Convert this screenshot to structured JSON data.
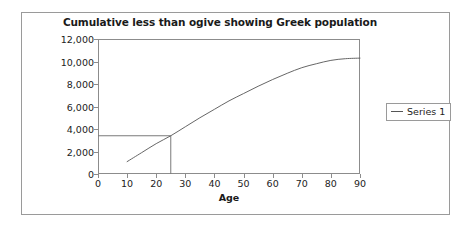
{
  "chart_data": {
    "type": "line",
    "title": "Cumulative less than ogive showing Greek population",
    "xlabel": "Age",
    "ylabel": "Population",
    "xlim": [
      0,
      90
    ],
    "ylim": [
      0,
      12000
    ],
    "grid": false,
    "legend_position": "right",
    "x_ticks": [
      0,
      10,
      20,
      30,
      40,
      50,
      60,
      70,
      80,
      90
    ],
    "x_tick_labels": [
      "0",
      "10",
      "20",
      "30",
      "40",
      "50",
      "60",
      "70",
      "80",
      "90"
    ],
    "y_ticks": [
      0,
      2000,
      4000,
      6000,
      8000,
      10000,
      12000
    ],
    "y_tick_labels": [
      "0",
      "2,000",
      "4,000",
      "6,000",
      "8,000",
      "10,000",
      "12,000"
    ],
    "series": [
      {
        "name": "Series 1",
        "color": "#555555",
        "x": [
          10,
          15,
          20,
          25,
          30,
          35,
          40,
          45,
          50,
          55,
          60,
          65,
          70,
          75,
          80,
          85,
          90
        ],
        "values": [
          1100,
          1900,
          2700,
          3400,
          4200,
          5000,
          5750,
          6500,
          7150,
          7800,
          8400,
          8950,
          9450,
          9800,
          10100,
          10250,
          10300
        ]
      }
    ],
    "annotations": [
      {
        "name": "median-construction-lines",
        "x": 25,
        "y": 3400,
        "description": "horizontal line from y-axis to curve at 3,400 and vertical line down to x-axis at age 25",
        "color": "#7a7a7a"
      }
    ]
  },
  "legend": {
    "items": [
      {
        "label": "Series 1",
        "marker": "line-marker"
      }
    ]
  },
  "colors": {
    "frame": "#9a9a9a",
    "axis": "#8c8c8c",
    "series": "#555555",
    "construction": "#7a7a7a",
    "text": "#222222",
    "background": "#ffffff"
  }
}
